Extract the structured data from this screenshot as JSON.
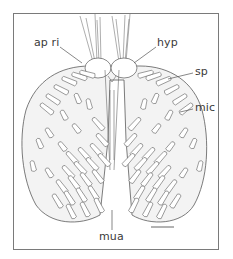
{
  "figure": {
    "type": "scientific-illustration",
    "labels": [
      {
        "id": "ap_ri",
        "text": "ap ri",
        "x": 34,
        "y": 41
      },
      {
        "id": "hyp",
        "text": "hyp",
        "x": 156,
        "y": 41
      },
      {
        "id": "sp",
        "text": "sp",
        "x": 195,
        "y": 69
      },
      {
        "id": "mic",
        "text": "mic",
        "x": 195,
        "y": 105
      },
      {
        "id": "mua",
        "text": "mua",
        "x": 99,
        "y": 233
      }
    ],
    "scale_bar": {
      "present": true,
      "x1": 151,
      "x2": 174,
      "y": 227
    },
    "colors": {
      "line": "#5a5a5a",
      "frame": "#7a7a7a",
      "shading": "#eeeeee",
      "text": "#3a3a3a"
    }
  }
}
